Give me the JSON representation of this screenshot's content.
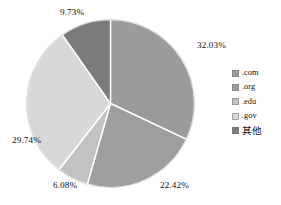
{
  "chart_data": {
    "type": "pie",
    "title": "",
    "subtitle": "",
    "xlabel": "",
    "ylabel": "",
    "legend_position": "right",
    "grid": false,
    "start_angle_deg": 0,
    "direction": "clockwise",
    "categories": [
      ".com",
      ".org",
      ".edu",
      ".gov",
      "其他"
    ],
    "values": [
      32.03,
      22.42,
      6.08,
      29.74,
      9.73
    ],
    "value_labels": [
      "32.03%",
      "22.42%",
      "6.08%",
      "29.74%",
      "9.73%"
    ],
    "colors": [
      "#9b9b9b",
      "#9e9e9e",
      "#c2c2c2",
      "#d8d8d8",
      "#7b7b7b"
    ],
    "slices": [
      {
        "label": ".com",
        "value": 32.03,
        "value_label": "32.03%",
        "color": "#9b9b9b"
      },
      {
        "label": ".org",
        "value": 22.42,
        "value_label": "22.42%",
        "color": "#9e9e9e"
      },
      {
        "label": ".edu",
        "value": 6.08,
        "value_label": "6.08%",
        "color": "#c2c2c2"
      },
      {
        "label": ".gov",
        "value": 29.74,
        "value_label": "29.74%",
        "color": "#d8d8d8"
      },
      {
        "label": "其他",
        "value": 9.73,
        "value_label": "9.73%",
        "color": "#7b7b7b"
      }
    ]
  },
  "legend": {
    "items": [
      {
        "label": ".com",
        "color": "#9b9b9b"
      },
      {
        "label": ".org",
        "color": "#9e9e9e"
      },
      {
        "label": ".edu",
        "color": "#c2c2c2"
      },
      {
        "label": ".gov",
        "color": "#d8d8d8"
      },
      {
        "label": "其他",
        "color": "#7b7b7b"
      }
    ]
  },
  "style": {
    "separator_color": "#ffffff",
    "background": "#ffffff",
    "text_color": "#111111"
  }
}
